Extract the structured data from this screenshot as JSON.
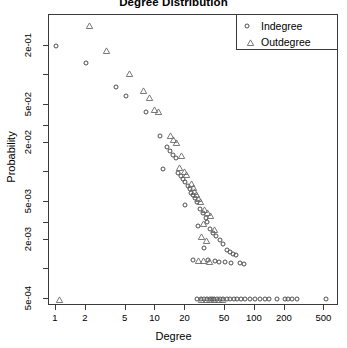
{
  "chart_data": {
    "type": "scatter",
    "title": "Degree Distribution",
    "xlabel": "Degree",
    "ylabel": "Probability",
    "xscale": "log",
    "yscale": "log",
    "xlim": [
      0.85,
      700
    ],
    "ylim": [
      0.00042,
      0.42
    ],
    "grid": false,
    "legend_position": "top-right",
    "xticks": [
      1,
      2,
      5,
      10,
      20,
      50,
      100,
      200,
      500
    ],
    "xtick_labels": [
      "1",
      "2",
      "5",
      "10",
      "20",
      "50",
      "100",
      "200",
      "500"
    ],
    "yticks": [
      0.2,
      0.05,
      0.02,
      0.005,
      0.002,
      0.0005
    ],
    "ytick_labels": [
      "2e-01",
      "5e-02",
      "2e-02",
      "5e-03",
      "2e-03",
      "5e-04"
    ],
    "series": [
      {
        "name": "Indegree",
        "marker": "circle",
        "color": "#4d4d4d",
        "points": [
          [
            1,
            0.2
          ],
          [
            2,
            0.135
          ],
          [
            4,
            0.0755
          ],
          [
            5,
            0.0615
          ],
          [
            8,
            0.0425
          ],
          [
            11,
            0.0235
          ],
          [
            13,
            0.0185
          ],
          [
            14,
            0.0168
          ],
          [
            15,
            0.0152
          ],
          [
            16,
            0.014
          ],
          [
            12,
            0.0108
          ],
          [
            17,
            0.0099
          ],
          [
            18,
            0.0092
          ],
          [
            19,
            0.0086
          ],
          [
            20,
            0.0079
          ],
          [
            21,
            0.0072
          ],
          [
            22,
            0.0068
          ],
          [
            23,
            0.0062
          ],
          [
            24,
            0.0058
          ],
          [
            25,
            0.0054
          ],
          [
            26,
            0.005
          ],
          [
            20,
            0.0046
          ],
          [
            28,
            0.0042
          ],
          [
            30,
            0.0038
          ],
          [
            32,
            0.0034
          ],
          [
            33,
            0.0031
          ],
          [
            27,
            0.0028
          ],
          [
            35,
            0.0026
          ],
          [
            38,
            0.0024
          ],
          [
            41,
            0.0022
          ],
          [
            45,
            0.002
          ],
          [
            48,
            0.00185
          ],
          [
            31,
            0.00165
          ],
          [
            52,
            0.00158
          ],
          [
            56,
            0.00152
          ],
          [
            60,
            0.00145
          ],
          [
            65,
            0.0014
          ],
          [
            24,
            0.00126
          ],
          [
            34,
            0.00124
          ],
          [
            40,
            0.00122
          ],
          [
            44,
            0.0012
          ],
          [
            50,
            0.00118
          ],
          [
            58,
            0.00117
          ],
          [
            70,
            0.00116
          ],
          [
            78,
            0.00115
          ],
          [
            26,
            0.0005
          ],
          [
            29,
            0.0005
          ],
          [
            31,
            0.0005
          ],
          [
            33,
            0.0005
          ],
          [
            35,
            0.0005
          ],
          [
            37,
            0.0005
          ],
          [
            39,
            0.0005
          ],
          [
            42,
            0.0005
          ],
          [
            45,
            0.0005
          ],
          [
            48,
            0.0005
          ],
          [
            52,
            0.0005
          ],
          [
            56,
            0.0005
          ],
          [
            61,
            0.0005
          ],
          [
            66,
            0.0005
          ],
          [
            72,
            0.0005
          ],
          [
            79,
            0.0005
          ],
          [
            90,
            0.0005
          ],
          [
            100,
            0.0005
          ],
          [
            112,
            0.0005
          ],
          [
            125,
            0.0005
          ],
          [
            140,
            0.0005
          ],
          [
            165,
            0.0005
          ],
          [
            200,
            0.0005
          ],
          [
            215,
            0.0005
          ],
          [
            235,
            0.0005
          ],
          [
            265,
            0.0005
          ],
          [
            520,
            0.0005
          ]
        ]
      },
      {
        "name": "Outdegree",
        "marker": "triangle",
        "color": "#6a6a6a",
        "points": [
          [
            2,
            0.33
          ],
          [
            3,
            0.185
          ],
          [
            5,
            0.105
          ],
          [
            7,
            0.0715
          ],
          [
            8,
            0.0605
          ],
          [
            9,
            0.0455
          ],
          [
            10,
            0.043
          ],
          [
            13,
            0.0245
          ],
          [
            14,
            0.0222
          ],
          [
            15,
            0.0205
          ],
          [
            17,
            0.015
          ],
          [
            16,
            0.0113
          ],
          [
            18,
            0.0104
          ],
          [
            19,
            0.0097
          ],
          [
            21,
            0.0077
          ],
          [
            22,
            0.007
          ],
          [
            23,
            0.0065
          ],
          [
            24,
            0.006
          ],
          [
            25,
            0.0054
          ],
          [
            26,
            0.0051
          ],
          [
            29,
            0.0042
          ],
          [
            31,
            0.0039
          ],
          [
            33,
            0.0036
          ],
          [
            28,
            0.003
          ],
          [
            36,
            0.0026
          ],
          [
            27,
            0.0022
          ],
          [
            30,
            0.002
          ],
          [
            25,
            0.00126
          ],
          [
            28,
            0.00124
          ],
          [
            32,
            0.00122
          ],
          [
            27,
            0.0005
          ],
          [
            30,
            0.0005
          ],
          [
            33,
            0.0005
          ],
          [
            36,
            0.0005
          ],
          [
            40,
            0.0005
          ],
          [
            44,
            0.0005
          ],
          [
            1,
            0.0005
          ]
        ]
      }
    ]
  },
  "legend": {
    "entries": [
      {
        "label": "Indegree",
        "marker": "circle"
      },
      {
        "label": "Outdegree",
        "marker": "triangle"
      }
    ]
  }
}
